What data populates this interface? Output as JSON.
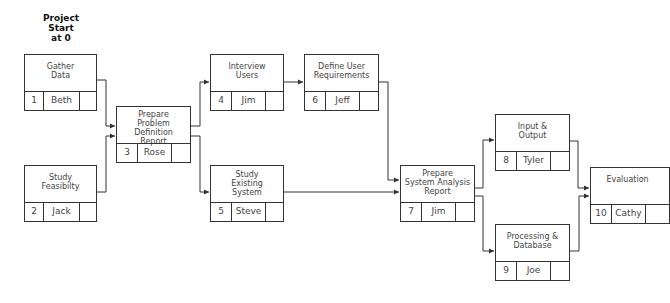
{
  "header": {
    "start_label": "Project\nStart\nat 0"
  },
  "nodes": [
    {
      "id": "1",
      "task": "Gather\nData",
      "owner": "Beth"
    },
    {
      "id": "2",
      "task": "Study\nFeasibilty",
      "owner": "Jack"
    },
    {
      "id": "3",
      "task": "Prepare\nProblem Definition\nReport",
      "owner": "Rose"
    },
    {
      "id": "4",
      "task": "Interview\nUsers",
      "owner": "Jim"
    },
    {
      "id": "5",
      "task": "Study\nExisting\nSystem",
      "owner": "Steve"
    },
    {
      "id": "6",
      "task": "Define User\nRequirements",
      "owner": "Jeff"
    },
    {
      "id": "7",
      "task": "Prepare\nSystem Analysis\nReport",
      "owner": "Jim"
    },
    {
      "id": "8",
      "task": "Input &\nOutput",
      "owner": "Tyler"
    },
    {
      "id": "9",
      "task": "Processing &\nDatabase",
      "owner": "Joe"
    },
    {
      "id": "10",
      "task": "Evaluation",
      "owner": "Cathy"
    }
  ],
  "edges": [
    [
      "1",
      "3"
    ],
    [
      "2",
      "3"
    ],
    [
      "3",
      "4"
    ],
    [
      "3",
      "5"
    ],
    [
      "4",
      "6"
    ],
    [
      "6",
      "7"
    ],
    [
      "5",
      "7"
    ],
    [
      "7",
      "8"
    ],
    [
      "7",
      "9"
    ],
    [
      "8",
      "10"
    ],
    [
      "9",
      "10"
    ]
  ]
}
